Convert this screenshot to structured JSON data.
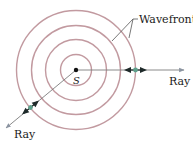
{
  "diagram": {
    "source_label": "S",
    "wavefronts_label": "Wavefronts",
    "ray_label_right": "Ray",
    "ray_label_lower": "Ray",
    "wavefront_count": 4,
    "colors": {
      "wavefront": "#c29aa0",
      "ray": "#7d7d7d",
      "ray_arrow": "#8a93a0",
      "marker": "#5fa08c",
      "arrow": "#1f2a2a",
      "text": "#1a1a1a",
      "source_dot": "#111111"
    }
  }
}
